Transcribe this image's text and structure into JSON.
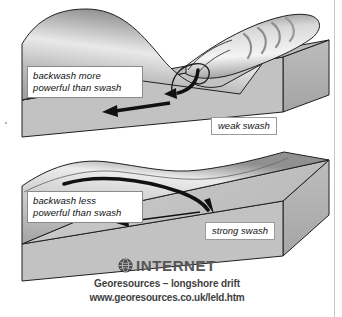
{
  "diagram": {
    "panels": [
      {
        "id": "destructive-wave",
        "callout": "backwash more\npowerful than swash",
        "swash_tag": "weak swash",
        "wave_description": "tall plunging breaker with foam arcs"
      },
      {
        "id": "constructive-wave",
        "callout": "backwash less\npowerful than swash",
        "swash_tag": "strong swash",
        "wave_description": "low spilling wave"
      }
    ]
  },
  "footer": {
    "icon": "globe-icon",
    "heading": "INTERNET",
    "subtitle": "Georesources – longshore drift",
    "url": "www.georesources.co.uk/leld.htm"
  },
  "colors": {
    "beach_top": "#b0b0b0",
    "beach_face": "#c4c4c4",
    "block_side": "#a8a8a8",
    "water_light": "#f2f2f2",
    "water_mid": "#b8b8b8",
    "water_dark": "#6f6f6f",
    "outline": "#1a1a1a",
    "text": "#3f3f3f"
  }
}
